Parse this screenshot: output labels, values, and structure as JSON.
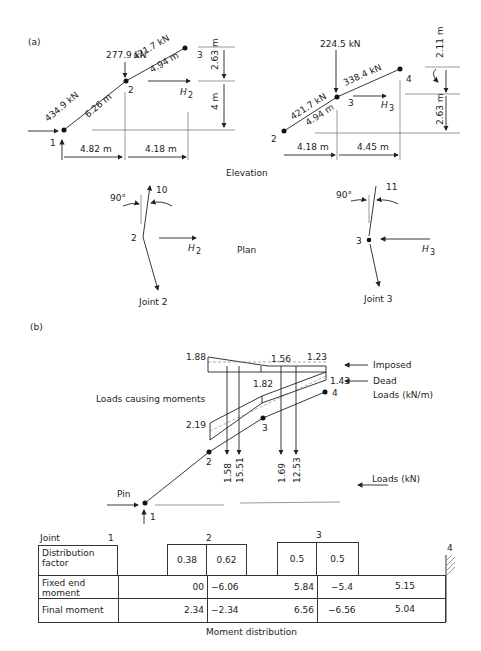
{
  "part_a": {
    "label": "(a)",
    "elevation_label": "Elevation",
    "plan_label": "Plan",
    "left": {
      "load": "277.9 kN",
      "force_upper": "421.7 kN",
      "force_lower": "434.9 kN",
      "len_upper": "4.94 m",
      "len_lower": "6.26 m",
      "h_force": "H",
      "h_sub": "2",
      "dim_h1": "4.82 m",
      "dim_h2": "4.18 m",
      "dim_v1": "2.63 m",
      "dim_v2": "4 m",
      "nodes": [
        "1",
        "2",
        "3"
      ]
    },
    "right": {
      "load": "224.5 kN",
      "force_upper": "338.4 kN",
      "force_lower": "421.7 kN",
      "len_lower": "4.94 m",
      "h_force": "H",
      "h_sub": "3",
      "dim_h1": "4.18 m",
      "dim_h2": "4.45 m",
      "dim_v1": "2.11 m",
      "dim_v2": "2.63 m",
      "nodes": [
        "2",
        "3",
        "4"
      ]
    },
    "plan_left": {
      "angle": "90°",
      "bend": "10",
      "node": "2",
      "h_force": "H",
      "h_sub": "2",
      "caption": "Joint 2"
    },
    "plan_right": {
      "angle": "90°",
      "bend": "11",
      "node": "3",
      "h_force": "H",
      "h_sub": "3",
      "caption": "Joint 3"
    }
  },
  "part_b": {
    "label": "(b)",
    "loads_caption": "Loads causing moments",
    "imposed": {
      "left": "1.88",
      "mid": "1.56",
      "right": "1.23",
      "label": "Imposed"
    },
    "dead": {
      "left": "2.19",
      "mid": "1.82",
      "right": "1.43",
      "label": "Dead",
      "units": "Loads (kN/m)"
    },
    "point_loads": [
      "1.58",
      "15.51",
      "1.69",
      "12.53"
    ],
    "point_loads_label": "Loads (kN)",
    "pin_label": "Pin",
    "nodes": [
      "1",
      "2",
      "3",
      "4"
    ]
  },
  "table": {
    "caption": "Moment distribution",
    "joint_label": "Joint",
    "joint_numbers": [
      "1",
      "2",
      "3",
      "4"
    ],
    "rows": [
      {
        "label": "Distribution factor",
        "values": [
          "",
          "0.38",
          "0.62",
          "0.5",
          "0.5",
          ""
        ]
      },
      {
        "label": "Fixed end moment",
        "values": [
          "",
          "00",
          "−6.06",
          "5.84",
          "−5.4",
          "5.15"
        ]
      },
      {
        "label": "Final moment",
        "values": [
          "",
          "2.34",
          "−2.34",
          "6.56",
          "−6.56",
          "5.04"
        ]
      }
    ]
  }
}
